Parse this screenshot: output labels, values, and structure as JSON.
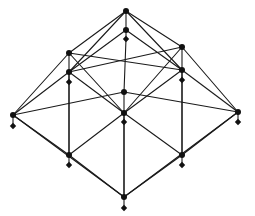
{
  "diagram": {
    "type": "lattice",
    "colors": {
      "stroke": "#1a1a1a",
      "node": "#111111",
      "background": "#ffffff"
    },
    "nodes": [
      {
        "id": "top",
        "x": 126,
        "y": 11,
        "shape": "dot"
      },
      {
        "id": "top2",
        "x": 126,
        "y": 30,
        "shape": "dot"
      },
      {
        "id": "top_d",
        "x": 126,
        "y": 39,
        "shape": "diamond"
      },
      {
        "id": "ul",
        "x": 69,
        "y": 53,
        "shape": "dot"
      },
      {
        "id": "ul2",
        "x": 69,
        "y": 72,
        "shape": "dot"
      },
      {
        "id": "ul_d",
        "x": 69,
        "y": 82,
        "shape": "diamond"
      },
      {
        "id": "ur",
        "x": 182,
        "y": 47,
        "shape": "dot"
      },
      {
        "id": "ur2",
        "x": 182,
        "y": 70,
        "shape": "dot"
      },
      {
        "id": "ur_d",
        "x": 182,
        "y": 80,
        "shape": "diamond"
      },
      {
        "id": "mid",
        "x": 124,
        "y": 92,
        "shape": "dot"
      },
      {
        "id": "mid2",
        "x": 124,
        "y": 113,
        "shape": "dot"
      },
      {
        "id": "mid_d",
        "x": 124,
        "y": 122,
        "shape": "diamond"
      },
      {
        "id": "left",
        "x": 13,
        "y": 115,
        "shape": "dot"
      },
      {
        "id": "left_d",
        "x": 13,
        "y": 126,
        "shape": "diamond"
      },
      {
        "id": "right",
        "x": 238,
        "y": 112,
        "shape": "dot"
      },
      {
        "id": "right_d",
        "x": 238,
        "y": 122,
        "shape": "diamond"
      },
      {
        "id": "ll",
        "x": 69,
        "y": 155,
        "shape": "dot"
      },
      {
        "id": "ll_d",
        "x": 69,
        "y": 165,
        "shape": "diamond"
      },
      {
        "id": "lr",
        "x": 182,
        "y": 155,
        "shape": "dot"
      },
      {
        "id": "lr_d",
        "x": 182,
        "y": 165,
        "shape": "diamond"
      },
      {
        "id": "bottom",
        "x": 124,
        "y": 197,
        "shape": "dot"
      },
      {
        "id": "bottom_d",
        "x": 124,
        "y": 208,
        "shape": "diamond"
      }
    ],
    "edges": [
      [
        "top",
        "top2"
      ],
      [
        "top",
        "ul"
      ],
      [
        "top",
        "ur"
      ],
      [
        "top",
        "ul2"
      ],
      [
        "top",
        "ur2"
      ],
      [
        "top2",
        "ul2"
      ],
      [
        "top2",
        "ur2"
      ],
      [
        "top_d",
        "mid"
      ],
      [
        "ul",
        "ul2"
      ],
      [
        "ul",
        "left"
      ],
      [
        "ul",
        "ur2"
      ],
      [
        "ul",
        "mid2"
      ],
      [
        "ul2",
        "mid2"
      ],
      [
        "ul2",
        "ll"
      ],
      [
        "ul2",
        "left"
      ],
      [
        "ur",
        "ur2"
      ],
      [
        "ur",
        "right"
      ],
      [
        "ur",
        "mid2"
      ],
      [
        "ur",
        "ul2"
      ],
      [
        "ur2",
        "mid2"
      ],
      [
        "ur2",
        "lr"
      ],
      [
        "ur2",
        "right"
      ],
      [
        "mid",
        "mid2"
      ],
      [
        "mid",
        "left"
      ],
      [
        "mid",
        "right"
      ],
      [
        "left",
        "ll"
      ],
      [
        "left",
        "bottom"
      ],
      [
        "right",
        "lr"
      ],
      [
        "right",
        "bottom"
      ],
      [
        "mid2",
        "ll"
      ],
      [
        "mid2",
        "lr"
      ],
      [
        "mid2",
        "bottom"
      ],
      [
        "ll",
        "bottom"
      ],
      [
        "lr",
        "bottom"
      ],
      [
        "ul_d",
        "ll"
      ],
      [
        "ur_d",
        "lr"
      ],
      [
        "mid_d",
        "bottom"
      ]
    ]
  }
}
